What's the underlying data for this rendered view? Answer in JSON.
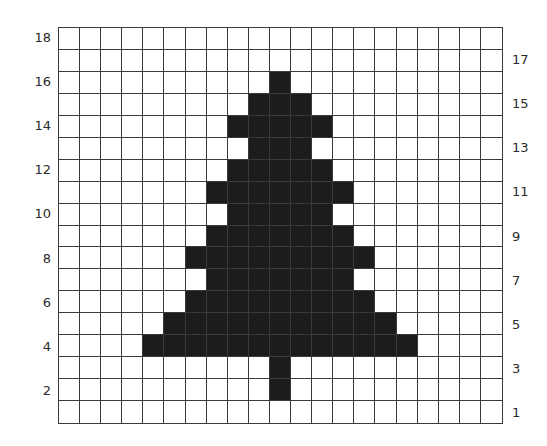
{
  "chart_data": {
    "type": "heatmap",
    "title": "",
    "columns": 21,
    "rows": 18,
    "row_labels_left": [
      "18",
      "16",
      "14",
      "12",
      "10",
      "8",
      "6",
      "4",
      "2"
    ],
    "row_labels_right": [
      "17",
      "15",
      "13",
      "11",
      "9",
      "7",
      "5",
      "3",
      "1"
    ],
    "colors": {
      "filled": "#1c1c1c",
      "empty": "#ffffff",
      "grid": "#3a3a3a"
    },
    "filled_cells_by_row": {
      "18": [],
      "17": [],
      "16": [
        10
      ],
      "15": [
        9,
        10,
        11
      ],
      "14": [
        8,
        9,
        10,
        11,
        12
      ],
      "13": [
        9,
        10,
        11
      ],
      "12": [
        8,
        9,
        10,
        11,
        12
      ],
      "11": [
        7,
        8,
        9,
        10,
        11,
        12,
        13
      ],
      "10": [
        8,
        9,
        10,
        11,
        12
      ],
      "9": [
        7,
        8,
        9,
        10,
        11,
        12,
        13
      ],
      "8": [
        6,
        7,
        8,
        9,
        10,
        11,
        12,
        13,
        14
      ],
      "7": [
        7,
        8,
        9,
        10,
        11,
        12,
        13
      ],
      "6": [
        6,
        7,
        8,
        9,
        10,
        11,
        12,
        13,
        14
      ],
      "5": [
        5,
        6,
        7,
        8,
        9,
        10,
        11,
        12,
        13,
        14,
        15
      ],
      "4": [
        4,
        5,
        6,
        7,
        8,
        9,
        10,
        11,
        12,
        13,
        14,
        15,
        16
      ],
      "3": [
        10
      ],
      "2": [
        10
      ],
      "1": []
    }
  }
}
